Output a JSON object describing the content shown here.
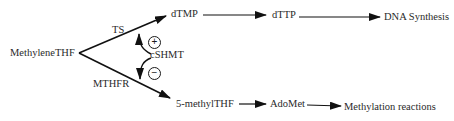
{
  "diagram": {
    "nodes": {
      "methylene_thf": "MethyleneTHF",
      "dtmp": "dTMP",
      "dttp": "dTTP",
      "dna_synthesis": "DNA Synthesis",
      "methyl_thf": "5-methylTHF",
      "adomet": "AdoMet",
      "methylation": "Methylation reactions"
    },
    "enzymes": {
      "ts": "TS",
      "mthfr": "MTHFR",
      "cshmt": "cSHMT"
    },
    "regulation": {
      "positive": "+",
      "negative": "−"
    },
    "edges": [
      {
        "from": "MethyleneTHF",
        "to": "dTMP",
        "label": "TS"
      },
      {
        "from": "MethyleneTHF",
        "to": "5-methylTHF",
        "label": "MTHFR"
      },
      {
        "from": "dTMP",
        "to": "dTTP"
      },
      {
        "from": "dTTP",
        "to": "DNA Synthesis"
      },
      {
        "from": "5-methylTHF",
        "to": "AdoMet"
      },
      {
        "from": "AdoMet",
        "to": "Methylation reactions"
      },
      {
        "from": "cSHMT",
        "to": "TS edge",
        "effect": "+"
      },
      {
        "from": "cSHMT",
        "to": "MTHFR edge",
        "effect": "−"
      }
    ],
    "colors": {
      "line": "#111111",
      "text": "#2a2a2a"
    }
  }
}
